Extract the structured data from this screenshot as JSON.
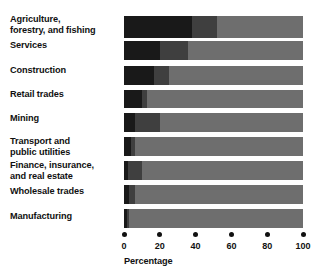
{
  "chart_data": {
    "type": "bar",
    "orientation": "horizontal",
    "stacked": true,
    "title": "",
    "xlabel": "Percentage",
    "ylabel": "",
    "xlim": [
      0,
      100
    ],
    "xticks": [
      0,
      20,
      40,
      60,
      80,
      100
    ],
    "xticklabels": [
      "0",
      "20",
      "40",
      "60",
      "80",
      "100"
    ],
    "grid": false,
    "legend": null,
    "categories": [
      "Agriculture, forestry, and fishing",
      "Services",
      "Construction",
      "Retail trades",
      "Mining",
      "Transport and public utilities",
      "Finance, insurance, and real estate",
      "Wholesale trades",
      "Manufacturing"
    ],
    "series": [
      {
        "name": "segment-1",
        "color": "#191919",
        "values": [
          38,
          20,
          17,
          10,
          6,
          4,
          2,
          3,
          1.5
        ]
      },
      {
        "name": "segment-2",
        "color": "#3f3f3f",
        "values": [
          14,
          16,
          8,
          3,
          14,
          2,
          8,
          3,
          1.5
        ]
      },
      {
        "name": "segment-3",
        "color": "#6e6e6e",
        "values": [
          48,
          64,
          75,
          87,
          80,
          94,
          90,
          94,
          97
        ]
      }
    ]
  },
  "labels": {
    "agriculture_line1": "Agriculture,",
    "agriculture_line2": "forestry, and fishing",
    "services": "Services",
    "construction": "Construction",
    "retail_trades": "Retail trades",
    "mining": "Mining",
    "transport_line1": "Transport and",
    "transport_line2": "public utilities",
    "finance_line1": "Finance, insurance,",
    "finance_line2": "and real estate",
    "wholesale_trades": "Wholesale trades",
    "manufacturing": "Manufacturing"
  },
  "axis": {
    "title": "Percentage",
    "tick_0": "0",
    "tick_20": "20",
    "tick_40": "40",
    "tick_60": "60",
    "tick_80": "80",
    "tick_100": "100"
  }
}
